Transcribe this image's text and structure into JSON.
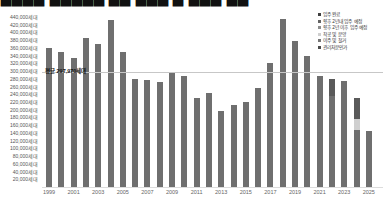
{
  "title": {
    "clipped_fragment": "▇▇▇▇ ▇▇▇▇▇ ▇▇ ▇▇▇ ▇ ▇▇▇ ▇▇"
  },
  "average_annotation": {
    "label": "평균 297,970세대"
  },
  "legend": {
    "items": [
      {
        "label": "입주 완료",
        "color": "#3f3f3f"
      },
      {
        "label": "향후 2년내 입주 예정",
        "color": "#636363"
      },
      {
        "label": "향후 2년 이후 입주 예정",
        "color": "#8c8c8c"
      },
      {
        "label": "착공 및 분양",
        "color": "#cfcfcf"
      },
      {
        "label": "이주 및 철거",
        "color": "#757575"
      },
      {
        "label": "관리처분인가",
        "color": "#4a4a4a"
      }
    ]
  },
  "y_axis": {
    "unit": "세대",
    "tick_values": [
      440000,
      420000,
      400000,
      380000,
      360000,
      340000,
      320000,
      300000,
      280000,
      260000,
      240000,
      220000,
      200000,
      180000,
      160000,
      140000,
      120000,
      100000,
      80000,
      60000,
      40000,
      20000
    ]
  },
  "x_axis": {
    "tick_labels": [
      "1999",
      "2001",
      "2003",
      "2005",
      "2007",
      "2009",
      "2011",
      "2013",
      "2015",
      "2017",
      "2019",
      "2021",
      "2023",
      "2025"
    ]
  },
  "chart_data": {
    "type": "bar",
    "title": "",
    "ylabel": "세대",
    "ylim": [
      0,
      440000
    ],
    "grid": false,
    "legend_position": "top-right",
    "bar_color": "#6f6f6f",
    "average_line": 297970,
    "categories": [
      1999,
      2000,
      2001,
      2002,
      2003,
      2004,
      2005,
      2006,
      2007,
      2008,
      2009,
      2010,
      2011,
      2012,
      2013,
      2014,
      2015,
      2016,
      2017,
      2018,
      2019,
      2020,
      2021,
      2022,
      2023,
      2024,
      2025
    ],
    "values": [
      360000,
      349000,
      333000,
      386000,
      370000,
      433000,
      350000,
      280000,
      278000,
      272000,
      298000,
      288000,
      230000,
      244000,
      196000,
      212000,
      219000,
      257000,
      322000,
      436000,
      378000,
      340000,
      288000,
      279000,
      274000,
      230000,
      146000
    ],
    "segmented_bars": {
      "2022": [
        {
          "value": 235000,
          "color": "#6f6f6f"
        },
        {
          "value": 44000,
          "color": "#5a5a5a"
        }
      ],
      "2024": [
        {
          "value": 147000,
          "color": "#6f6f6f"
        },
        {
          "value": 29000,
          "color": "#cfcfcf"
        },
        {
          "value": 54000,
          "color": "#5a5a5a"
        }
      ]
    }
  }
}
